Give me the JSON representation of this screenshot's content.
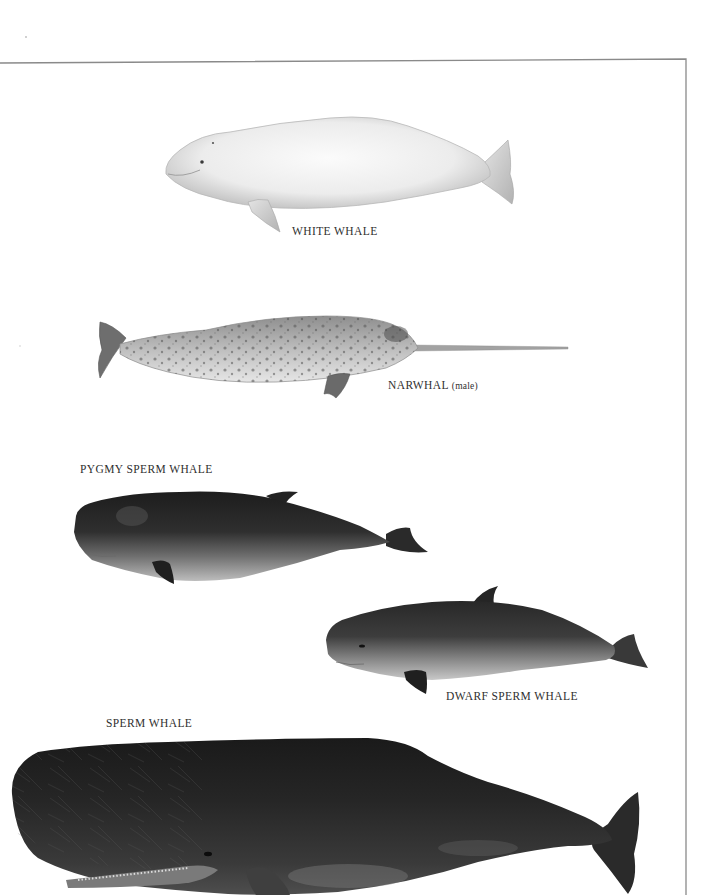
{
  "plate": {
    "frame": {
      "stroke_color": "#8a8a8a",
      "top_left_y": 63,
      "top_right_y": 59,
      "right_x": 686
    },
    "whales": [
      {
        "id": "white-whale",
        "label": "WHITE WHALE",
        "qualifier": "",
        "body_color": "#e9e9e9",
        "shade_color": "#bdbdbd"
      },
      {
        "id": "narwhal",
        "label": "NARWHAL",
        "qualifier": "(male)",
        "body_color": "#b9b9b9",
        "shade_color": "#6f6f6f",
        "tusk_color": "#9a9a9a"
      },
      {
        "id": "pygmy-sperm-whale",
        "label": "PYGMY SPERM WHALE",
        "qualifier": "",
        "body_color": "#2b2b2b",
        "belly_color": "#a8a8a8"
      },
      {
        "id": "dwarf-sperm-whale",
        "label": "DWARF SPERM WHALE",
        "qualifier": "",
        "body_color": "#3a3a3a",
        "belly_color": "#b3b3b3"
      },
      {
        "id": "sperm-whale",
        "label": "SPERM WHALE",
        "qualifier": "",
        "body_color": "#1e1e1e",
        "belly_color": "#6a6a6a"
      }
    ]
  }
}
